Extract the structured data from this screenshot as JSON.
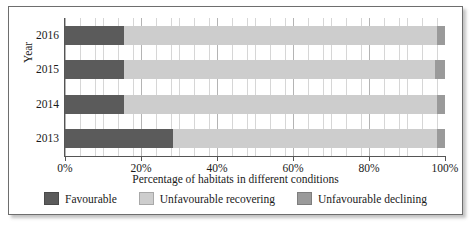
{
  "chart_data": {
    "type": "bar",
    "orientation": "horizontal",
    "stacked": true,
    "title": "",
    "xlabel": "Percentage of habitats in different conditions",
    "ylabel": "Year",
    "categories": [
      "2016",
      "2015",
      "2014",
      "2013"
    ],
    "xlim": [
      0,
      100
    ],
    "xticks": [
      0,
      20,
      40,
      60,
      80,
      100
    ],
    "xtick_labels": [
      "0%",
      "20%",
      "40%",
      "60%",
      "80%",
      "100%"
    ],
    "grid": true,
    "grid_axis": "x",
    "legend_position": "bottom",
    "series": [
      {
        "name": "Favourable",
        "color": "#5b5b5b",
        "values": [
          15.5,
          15.5,
          15.5,
          28.5
        ]
      },
      {
        "name": "Unfavourable recovering",
        "color": "#cdcdcd",
        "values": [
          82.5,
          82.0,
          82.5,
          69.5
        ]
      },
      {
        "name": "Unfavourable declining",
        "color": "#9a9a9a",
        "values": [
          2.0,
          2.5,
          2.0,
          2.0
        ]
      }
    ]
  },
  "axes": {
    "y_title": "Year",
    "x_title": "Percentage of habitats in different conditions",
    "y_tick_labels": [
      "2016",
      "2015",
      "2014",
      "2013"
    ],
    "x_tick_labels": [
      "0%",
      "20%",
      "40%",
      "60%",
      "80%",
      "100%"
    ]
  },
  "legend": {
    "items": [
      {
        "label": "Favourable",
        "color": "#5b5b5b"
      },
      {
        "label": "Unfavourable recovering",
        "color": "#cdcdcd"
      },
      {
        "label": "Unfavourable declining",
        "color": "#9a9a9a"
      }
    ]
  }
}
